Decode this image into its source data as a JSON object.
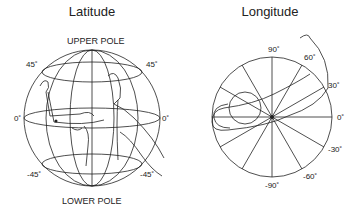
{
  "latitude_panel": {
    "title": "Latitude",
    "upper_label": "UPPER POLE",
    "lower_label": "LOWER POLE",
    "labels": {
      "left_45": "45˚",
      "right_45": "45˚",
      "left_0": "0˚",
      "right_0": "0˚",
      "left_neg45": "-45˚",
      "right_neg45": "-45˚"
    }
  },
  "longitude_panel": {
    "title": "Longitude",
    "labels": {
      "deg90": "90˚",
      "deg60": "60˚",
      "deg30": "30˚",
      "deg0": "0˚",
      "degneg30": "-30˚",
      "degneg60": "-60˚",
      "degneg90": "-90˚"
    }
  },
  "colors": {
    "line": "#222222",
    "background": "#ffffff"
  }
}
